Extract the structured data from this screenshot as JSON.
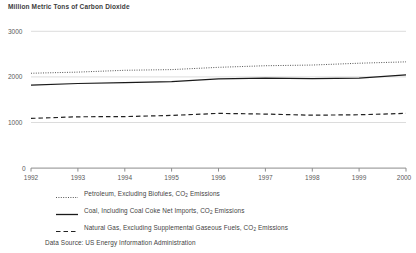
{
  "chart_data": {
    "type": "line",
    "title": "Million Metric Tons of Carbon Dioxide",
    "xlabel": "",
    "ylabel": "",
    "x": [
      1992,
      1993,
      1994,
      1995,
      1996,
      1997,
      1998,
      1999,
      2000
    ],
    "xtick_labels": [
      "1992",
      "1993",
      "1994",
      "1995",
      "1996",
      "1997",
      "1998",
      "1999",
      "2000"
    ],
    "ytick_labels": [
      "0",
      "1000",
      "2000",
      "3000"
    ],
    "yticks": [
      0,
      1000,
      2000,
      3000
    ],
    "ylim": [
      0,
      3000
    ],
    "xlim": [
      1992,
      2000
    ],
    "grid": "horizontal",
    "legend_position": "below-plot",
    "series": [
      {
        "name": "Petroleum, Excluding Biofuels, CO2 Emissions",
        "style": "dotted",
        "color": "#555555",
        "values": [
          2080,
          2105,
          2145,
          2160,
          2210,
          2245,
          2260,
          2300,
          2330
        ]
      },
      {
        "name": "Coal, Including Coal Coke Net Imports, CO2 Emissions",
        "style": "solid",
        "color": "#1a1a1a",
        "values": [
          1820,
          1855,
          1875,
          1895,
          1955,
          1975,
          1960,
          1975,
          2045
        ]
      },
      {
        "name": "Natural Gas, Excluding Supplemental Gaseous Fuels, CO2 Emissions",
        "style": "dashed",
        "color": "#222222",
        "values": [
          1090,
          1125,
          1130,
          1155,
          1200,
          1185,
          1160,
          1170,
          1200
        ]
      }
    ],
    "source": "Data Source: US Energy Information Administration"
  },
  "legend": {
    "items": [
      {
        "marker": "dotted-line-marker",
        "prefix": "Petroleum, Excluding Biofules, CO",
        "sub": "2",
        "suffix": " Emissions"
      },
      {
        "marker": "solid-line-marker",
        "prefix": "Coal, Including Coal Coke Net Imports, CO",
        "sub": "2",
        "suffix": " Emissions"
      },
      {
        "marker": "dashed-line-marker",
        "prefix": "Natural Gas, Excluding Supplemental Gaseous Fuels, CO",
        "sub": "2",
        "suffix": " Emissions"
      }
    ]
  },
  "colors": {
    "background": "#ffffff",
    "grid": "#dcdcdc",
    "axis": "#8c8c8c",
    "text": "#4a4a4a"
  }
}
